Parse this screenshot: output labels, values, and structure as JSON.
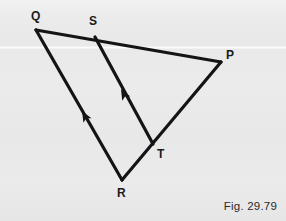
{
  "figure": {
    "caption": "Fig. 29.79",
    "background_color": "#eaeaea",
    "ink_color": "#141414",
    "width": 286,
    "height": 221
  },
  "geometry": {
    "type": "triangle-with-parallel-transversal",
    "description": "Triangle P Q R with segment S T drawn inside, S on QP and T on RP; ST is marked parallel to QR by single arrowheads.",
    "vertices": [
      {
        "name": "Q",
        "label": "Q",
        "x": 36,
        "y": 30,
        "label_x": 31,
        "label_y": 10
      },
      {
        "name": "S",
        "label": "S",
        "x": 95,
        "y": 37,
        "label_x": 89,
        "label_y": 15
      },
      {
        "name": "P",
        "label": "P",
        "x": 221,
        "y": 62,
        "label_x": 226,
        "label_y": 49
      },
      {
        "name": "T",
        "label": "T",
        "x": 153,
        "y": 144,
        "label_x": 157,
        "label_y": 148
      },
      {
        "name": "R",
        "label": "R",
        "x": 122,
        "y": 180,
        "label_x": 117,
        "label_y": 187
      }
    ],
    "segments": [
      {
        "name": "QP",
        "from": "Q",
        "to": "P",
        "marker": "none"
      },
      {
        "name": "QR",
        "from": "Q",
        "to": "R",
        "marker": "single-arrow-toward-Q"
      },
      {
        "name": "RP",
        "from": "R",
        "to": "P",
        "marker": "none"
      },
      {
        "name": "ST",
        "from": "S",
        "to": "T",
        "marker": "single-arrow-toward-S"
      }
    ],
    "parallel_marks": [
      {
        "name": "arrow-on-QR",
        "x": 82,
        "y": 111,
        "angle_deg": 240.2,
        "points_toward": "Q"
      },
      {
        "name": "arrow-on-ST",
        "x": 121,
        "y": 89,
        "angle_deg": 241.5,
        "points_toward": "S"
      }
    ]
  }
}
